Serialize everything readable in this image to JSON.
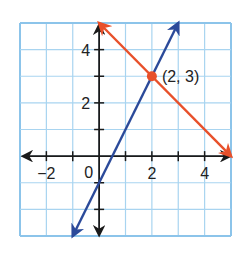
{
  "chart_data": {
    "type": "line",
    "title": "",
    "xlabel": "",
    "ylabel": "",
    "xlim": [
      -3,
      5
    ],
    "ylim": [
      -3,
      5
    ],
    "grid": true,
    "x_tick_labels": [
      {
        "value": -2,
        "label": "−2"
      },
      {
        "value": 2,
        "label": "2"
      },
      {
        "value": 4,
        "label": "4"
      }
    ],
    "y_tick_labels": [
      {
        "value": 2,
        "label": "2"
      },
      {
        "value": 4,
        "label": "4"
      }
    ],
    "origin_label": "0",
    "x_ticks": [
      -2,
      -1,
      1,
      2,
      3,
      4
    ],
    "y_ticks": [
      -2,
      -1,
      1,
      2,
      3,
      4
    ],
    "series": [
      {
        "name": "y = -x + 5",
        "color": "#E8502A",
        "points": [
          [
            0,
            5
          ],
          [
            5,
            0
          ]
        ],
        "arrows": "both"
      },
      {
        "name": "y = 2x - 1",
        "color": "#2B4A9A",
        "points": [
          [
            -1,
            -3
          ],
          [
            3,
            5
          ]
        ],
        "arrows": "both"
      }
    ],
    "annotations": [
      {
        "type": "point",
        "x": 2,
        "y": 3,
        "label": "(2, 3)",
        "color": "#E8502A"
      }
    ],
    "legend": "none"
  },
  "colors": {
    "grid": "#A8D4F0",
    "grid_border": "#8CC4EA",
    "axis": "#1A1A1A"
  }
}
